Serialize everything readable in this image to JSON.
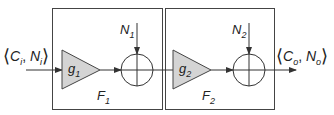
{
  "input_label": {
    "main": "C",
    "sub": "i",
    "main2": "N",
    "sub2": "i"
  },
  "output_label": {
    "main": "C",
    "sub": "o",
    "main2": "N",
    "sub2": "o"
  },
  "blocks": [
    {
      "name": "F",
      "sub": "1",
      "gain": "g",
      "gain_sub": "1",
      "noise": "N",
      "noise_sub": "1"
    },
    {
      "name": "F",
      "sub": "2",
      "gain": "g",
      "gain_sub": "2",
      "noise": "N",
      "noise_sub": "2"
    }
  ],
  "colors": {
    "stroke": "#333333",
    "triangle_fill": "#d4d4d4",
    "text": "#222222"
  }
}
